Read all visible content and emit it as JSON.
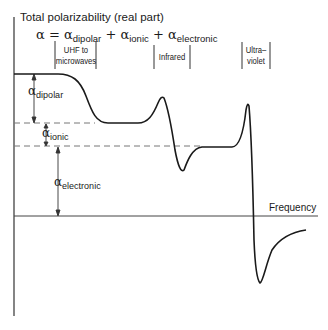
{
  "diagram": {
    "title": "Total polarizability (real part)",
    "equation": {
      "lhs": "α = ",
      "terms": [
        {
          "symbol": "α",
          "sub": "dipolar"
        },
        {
          "symbol": "α",
          "sub": "ionic"
        },
        {
          "symbol": "α",
          "sub": "electronic"
        }
      ],
      "plus": "+"
    },
    "bands": [
      {
        "label_line1": "UHF to",
        "label_line2": "microwaves"
      },
      {
        "label_line1": "Infrared",
        "label_line2": ""
      },
      {
        "label_line1": "Ultra–",
        "label_line2": "violet"
      }
    ],
    "contributions": [
      {
        "symbol": "α",
        "sub": "dipolar"
      },
      {
        "symbol": "α",
        "sub": "ionic"
      },
      {
        "symbol": "α",
        "sub": "electronic"
      }
    ],
    "x_axis_label": "Frequency",
    "colors": {
      "curve": "#1a1a1a",
      "axis": "#333333",
      "dashed": "#777777"
    }
  }
}
